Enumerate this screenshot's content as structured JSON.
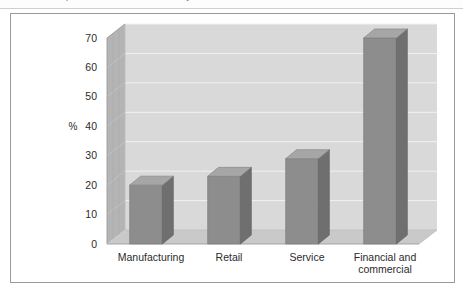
{
  "page": {
    "top_text_fragment": "The adoption of EDI and e-commerce by sector",
    "background_color": "#ffffff"
  },
  "figure": {
    "frame_border_color": "#9a9a9a"
  },
  "chart_data": {
    "type": "bar",
    "title": "",
    "subtitle": "",
    "xlabel": "",
    "ylabel": "%",
    "categories": [
      "Manufacturing",
      "Retail",
      "Service",
      "Financial and\ncommercial"
    ],
    "category_lines": [
      [
        "Manufacturing"
      ],
      [
        "Retail"
      ],
      [
        "Service"
      ],
      [
        "Financial and",
        "commercial"
      ]
    ],
    "values": [
      20,
      23,
      29,
      70
    ],
    "ylim": [
      0,
      70
    ],
    "yticks": [
      0,
      10,
      20,
      30,
      40,
      50,
      60,
      70
    ],
    "ytick_labels": [
      "0",
      "10",
      "20",
      "30",
      "40",
      "50",
      "60",
      "70"
    ],
    "grid": true,
    "grid_axis": "y",
    "legend": false,
    "legend_position": "none",
    "three_d": true,
    "colors": {
      "bar_front": "#8d8d8d",
      "bar_side": "#6f6f6f",
      "bar_top": "#a6a6a6",
      "wall_back": "#d9d9d9",
      "wall_left": "#b4b4b4",
      "floor": "#c9c9c9",
      "gridline": "#f2f2f2",
      "axis_text": "#2b2b2b"
    }
  }
}
